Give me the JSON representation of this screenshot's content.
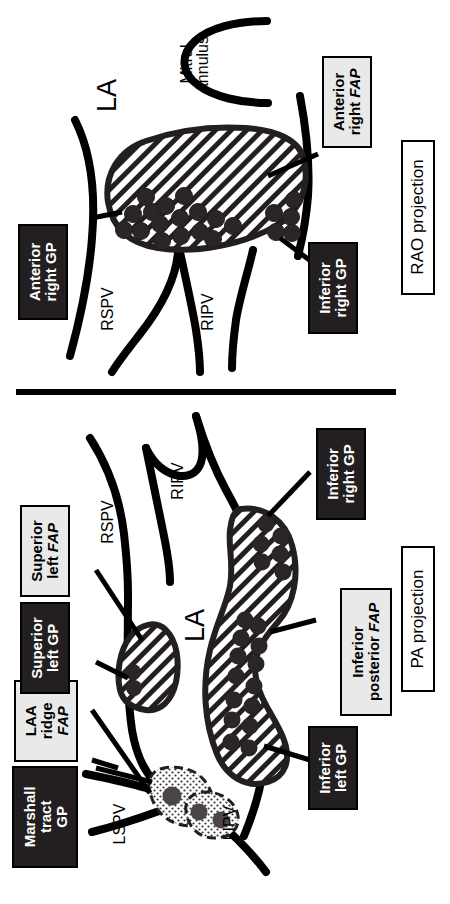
{
  "figure": {
    "orientation": "text rotated 90 degrees counter-clockwise",
    "divider": "horizontal-rule-between-panels"
  },
  "colors": {
    "gp_box_fill": "#231f20",
    "gp_box_text": "#ffffff",
    "fap_box_fill": "#e9e9e9",
    "fap_box_text": "#000000",
    "projection_box_fill": "#ffffff",
    "stroke": "#000000",
    "dot_fill": "#2a2526",
    "ridge_dot_fill": "#4a4546"
  },
  "panels": [
    {
      "id": "rao",
      "projection_label": "RAO projection",
      "chamber_label": "LA",
      "structures": [
        {
          "name": "Mitral annulus",
          "label": "Mitral annulus"
        }
      ],
      "vein_labels": [
        {
          "abbr": "RSPV",
          "full": "right superior pulmonary vein"
        },
        {
          "abbr": "RIPV",
          "full": "right inferior pulmonary vein"
        }
      ],
      "labels": [
        {
          "id": "rao-ant-right-gp",
          "kind": "GP",
          "lines": [
            "Anterior",
            "right GP"
          ],
          "italic_word": null
        },
        {
          "id": "rao-inf-right-gp",
          "kind": "GP",
          "lines": [
            "Inferior",
            "right GP"
          ],
          "italic_word": null
        },
        {
          "id": "rao-ant-right-fap",
          "kind": "FAP",
          "lines": [
            "Anterior",
            "right FAP"
          ],
          "italic_word": "FAP"
        }
      ]
    },
    {
      "id": "pa",
      "projection_label": "PA projection",
      "chamber_label": "LA",
      "structures": [],
      "vein_labels": [
        {
          "abbr": "RSPV",
          "full": "right superior pulmonary vein"
        },
        {
          "abbr": "RIPV",
          "full": "right inferior pulmonary vein"
        },
        {
          "abbr": "LSPV",
          "full": "left superior pulmonary vein"
        },
        {
          "abbr": "LIPV",
          "full": "left inferior pulmonary vein"
        }
      ],
      "labels": [
        {
          "id": "pa-marshall-gp",
          "kind": "GP",
          "lines": [
            "Marshall",
            "tract",
            "GP"
          ],
          "italic_word": null
        },
        {
          "id": "pa-laa-ridge-fap",
          "kind": "FAP",
          "lines": [
            "LAA",
            "ridge",
            "FAP"
          ],
          "italic_word": "FAP"
        },
        {
          "id": "pa-sup-left-gp",
          "kind": "GP",
          "lines": [
            "Superior",
            "left GP"
          ],
          "italic_word": null
        },
        {
          "id": "pa-sup-left-fap",
          "kind": "FAP",
          "lines": [
            "Superior",
            "left FAP"
          ],
          "italic_word": "FAP"
        },
        {
          "id": "pa-inf-right-gp",
          "kind": "GP",
          "lines": [
            "Inferior",
            "right GP"
          ],
          "italic_word": null
        },
        {
          "id": "pa-inf-post-fap",
          "kind": "FAP",
          "lines": [
            "Inferior",
            "posterior FAP"
          ],
          "italic_word": "FAP"
        },
        {
          "id": "pa-inf-left-gp",
          "kind": "GP",
          "lines": [
            "Inferior",
            "left GP"
          ],
          "italic_word": null
        }
      ]
    }
  ],
  "text": {
    "rao_projection": "RAO projection",
    "pa_projection": "PA projection",
    "la": "LA",
    "mitral_annulus_l1": "Mitral",
    "mitral_annulus_l2": "annulus",
    "rspv": "RSPV",
    "ripv": "RIPV",
    "lspv": "LSPV",
    "lipv": "LIPV",
    "anterior": "Anterior",
    "right_gp": "right GP",
    "inferior": "Inferior",
    "right_fap_pre": "right ",
    "fap": "FAP",
    "gp": "GP",
    "marshall": "Marshall",
    "tract": "tract",
    "laa": "LAA",
    "ridge": "ridge",
    "superior": "Superior",
    "left_gp": "left GP",
    "left_pre": "left ",
    "posterior_pre": "posterior ",
    "inferior_left_gp": "left GP"
  }
}
